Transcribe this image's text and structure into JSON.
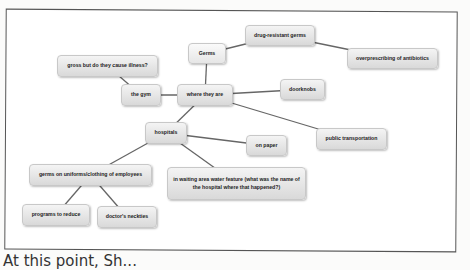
{
  "diagram": {
    "type": "concept-map",
    "nodes": [
      {
        "id": "germs",
        "label": "Germs",
        "x": 188,
        "y": 43,
        "w": 38,
        "h": 21
      },
      {
        "id": "drug",
        "label": "drug-resistant germs",
        "x": 245,
        "y": 25,
        "w": 70,
        "h": 21
      },
      {
        "id": "overpres",
        "label": "overprescribing of antibiotics",
        "x": 347,
        "y": 48,
        "w": 91,
        "h": 21
      },
      {
        "id": "gross",
        "label": "gross but do they cause illness?",
        "x": 57,
        "y": 55,
        "w": 101,
        "h": 22
      },
      {
        "id": "gym",
        "label": "the gym",
        "x": 121,
        "y": 84,
        "w": 40,
        "h": 22
      },
      {
        "id": "where",
        "label": "where they are",
        "x": 177,
        "y": 84,
        "w": 56,
        "h": 22
      },
      {
        "id": "door",
        "label": "doorknobs",
        "x": 280,
        "y": 79,
        "w": 45,
        "h": 21
      },
      {
        "id": "hosp",
        "label": "hospitals",
        "x": 145,
        "y": 122,
        "w": 42,
        "h": 22
      },
      {
        "id": "paper",
        "label": "on paper",
        "x": 246,
        "y": 135,
        "w": 41,
        "h": 21
      },
      {
        "id": "public",
        "label": "public transportation",
        "x": 316,
        "y": 128,
        "w": 71,
        "h": 22
      },
      {
        "id": "waiting",
        "label": "in waiting area water feature (what was the name of the hospital where that happened?)",
        "x": 167,
        "y": 167,
        "w": 139,
        "h": 33
      },
      {
        "id": "uniforms",
        "label": "germs on uniforms/clothing of employees",
        "x": 29,
        "y": 164,
        "w": 123,
        "h": 22
      },
      {
        "id": "programs",
        "label": "programs to reduce",
        "x": 22,
        "y": 204,
        "w": 68,
        "h": 22
      },
      {
        "id": "neckties",
        "label": "doctor's neckties",
        "x": 97,
        "y": 206,
        "w": 60,
        "h": 22
      }
    ],
    "edges": [
      [
        "germs",
        "where"
      ],
      [
        "germs",
        "drug"
      ],
      [
        "drug",
        "overpres"
      ],
      [
        "gross",
        "gym"
      ],
      [
        "gym",
        "where"
      ],
      [
        "where",
        "door"
      ],
      [
        "where",
        "public"
      ],
      [
        "where",
        "hosp"
      ],
      [
        "hosp",
        "paper"
      ],
      [
        "hosp",
        "waiting"
      ],
      [
        "hosp",
        "uniforms"
      ],
      [
        "uniforms",
        "programs"
      ],
      [
        "uniforms",
        "neckties"
      ]
    ]
  },
  "caption": "At this point, Sh..."
}
